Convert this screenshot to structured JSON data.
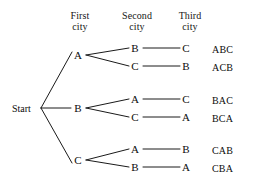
{
  "diagram": {
    "type": "tree",
    "background_color": "#ffffff",
    "line_color": "#1a1a1a",
    "text_color": "#0c0c0c"
  },
  "headers": [
    {
      "line1": "First",
      "line2": "city",
      "x": 80,
      "y": 10
    },
    {
      "line1": "Second",
      "line2": "city",
      "x": 137,
      "y": 10
    },
    {
      "line1": "Third",
      "line2": "city",
      "x": 190,
      "y": 10
    }
  ],
  "root": {
    "label": "Start",
    "x": 12,
    "y": 104,
    "vertex_x": 41,
    "vertex_y": 108
  },
  "level1": [
    {
      "label": "A",
      "x": 78,
      "y": 55
    },
    {
      "label": "B",
      "x": 78,
      "y": 108
    },
    {
      "label": "C",
      "x": 78,
      "y": 160
    }
  ],
  "level2": [
    {
      "label": "B",
      "x": 135,
      "y": 50,
      "parent": "A"
    },
    {
      "label": "C",
      "x": 135,
      "y": 67,
      "parent": "A"
    },
    {
      "label": "A",
      "x": 135,
      "y": 100,
      "parent": "B"
    },
    {
      "label": "C",
      "x": 135,
      "y": 117,
      "parent": "B"
    },
    {
      "label": "A",
      "x": 135,
      "y": 150,
      "parent": "C"
    },
    {
      "label": "B",
      "x": 135,
      "y": 167,
      "parent": "C"
    }
  ],
  "level3": [
    {
      "label": "C",
      "x": 186,
      "y": 50
    },
    {
      "label": "B",
      "x": 186,
      "y": 67
    },
    {
      "label": "C",
      "x": 186,
      "y": 100
    },
    {
      "label": "A",
      "x": 186,
      "y": 117
    },
    {
      "label": "B",
      "x": 186,
      "y": 150
    },
    {
      "label": "A",
      "x": 186,
      "y": 167
    }
  ],
  "results": [
    {
      "label": "ABC",
      "x": 212,
      "y": 50
    },
    {
      "label": "ACB",
      "x": 212,
      "y": 67
    },
    {
      "label": "BAC",
      "x": 212,
      "y": 100
    },
    {
      "label": "BCA",
      "x": 212,
      "y": 117
    },
    {
      "label": "CAB",
      "x": 212,
      "y": 150
    },
    {
      "label": "CBA",
      "x": 212,
      "y": 167
    }
  ],
  "edges": [
    {
      "from": "start",
      "to": "A",
      "x1": 41,
      "y1": 108,
      "x2": 72,
      "y2": 52
    },
    {
      "from": "start",
      "to": "B",
      "x1": 41,
      "y1": 108,
      "x2": 71,
      "y2": 108
    },
    {
      "from": "start",
      "to": "C",
      "x1": 41,
      "y1": 108,
      "x2": 72,
      "y2": 163
    },
    {
      "from": "A",
      "to": "B2",
      "x1": 86,
      "y1": 55,
      "x2": 129,
      "y2": 48
    },
    {
      "from": "A",
      "to": "C2",
      "x1": 86,
      "y1": 55,
      "x2": 129,
      "y2": 66
    },
    {
      "from": "B",
      "to": "A2",
      "x1": 86,
      "y1": 108,
      "x2": 129,
      "y2": 99
    },
    {
      "from": "B",
      "to": "C2",
      "x1": 86,
      "y1": 108,
      "x2": 129,
      "y2": 117
    },
    {
      "from": "C",
      "to": "A2",
      "x1": 86,
      "y1": 160,
      "x2": 129,
      "y2": 149
    },
    {
      "from": "C",
      "to": "B2",
      "x1": 86,
      "y1": 160,
      "x2": 129,
      "y2": 167
    },
    {
      "from": "B2",
      "to": "C3",
      "x1": 143,
      "y1": 48,
      "x2": 180,
      "y2": 48
    },
    {
      "from": "C2",
      "to": "B3",
      "x1": 143,
      "y1": 66,
      "x2": 180,
      "y2": 66
    },
    {
      "from": "A2",
      "to": "C3",
      "x1": 143,
      "y1": 99,
      "x2": 180,
      "y2": 99
    },
    {
      "from": "C2",
      "to": "A3",
      "x1": 143,
      "y1": 117,
      "x2": 180,
      "y2": 117
    },
    {
      "from": "A2",
      "to": "B3",
      "x1": 143,
      "y1": 149,
      "x2": 180,
      "y2": 149
    },
    {
      "from": "B2",
      "to": "A3",
      "x1": 143,
      "y1": 167,
      "x2": 180,
      "y2": 167
    }
  ]
}
